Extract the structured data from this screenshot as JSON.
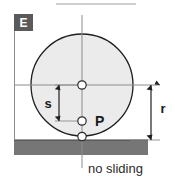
{
  "figure": {
    "panel_label": "E",
    "labels": {
      "radius": "r",
      "offset": "s",
      "contact_point": "P"
    },
    "caption": "no sliding",
    "colors": {
      "panel_box": "#5a5a5a",
      "panel_text": "#ffffff",
      "disk_fill": "#ebebeb",
      "disk_stroke": "#1f1f1f",
      "ground_fill": "#767676",
      "ground_stroke": "#4a4a4a",
      "axis_line": "#8c8c8c",
      "dim_line": "#1f1f1f",
      "node_fill": "#ffffff",
      "node_stroke": "#2a2a2a",
      "text": "#1a1a1a",
      "background": "#ffffff"
    },
    "geometry": {
      "disk_center_x": 82,
      "disk_center_y": 85,
      "disk_radius": 51,
      "contact_y": 136,
      "offset_point_y": 121,
      "ground_top_y": 140,
      "ground_bottom_y": 155,
      "ground_left_x": 14,
      "ground_right_x": 148
    },
    "nodes": [
      {
        "name": "disk-center-node",
        "x": 82,
        "y": 85
      },
      {
        "name": "offset-point-node",
        "x": 82,
        "y": 121
      },
      {
        "name": "contact-point-node",
        "x": 82,
        "y": 136
      }
    ]
  }
}
